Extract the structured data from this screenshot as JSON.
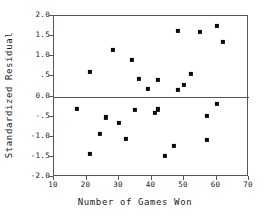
{
  "chart_data": {
    "type": "scatter",
    "title": "",
    "xlabel": "Number of Games Won",
    "ylabel": "Standardized Residual",
    "xlim": [
      10,
      70
    ],
    "ylim": [
      -2.0,
      2.0
    ],
    "grid": false,
    "legend": null,
    "xticks": [
      10,
      20,
      30,
      40,
      50,
      60,
      70
    ],
    "xticklabels": [
      "10",
      "20",
      "30",
      "40",
      "50",
      "60",
      "70"
    ],
    "yticks": [
      2.0,
      1.5,
      1.0,
      0.5,
      0.0,
      -0.5,
      -1.0,
      -1.5,
      -2.0
    ],
    "yticklabels": [
      "2.0",
      "1.5",
      "1.0",
      ".5",
      "0.0",
      "-.5",
      "-1.0",
      "-1.5",
      "-2.0"
    ],
    "reference_line": {
      "axis": "y",
      "value": 0.0
    },
    "marker": "filled-square",
    "marker_color": "#0a0a0a",
    "points": [
      {
        "x": 17,
        "y": -0.3
      },
      {
        "x": 21,
        "y": 0.62
      },
      {
        "x": 21,
        "y": -1.43
      },
      {
        "x": 24,
        "y": -0.93
      },
      {
        "x": 26,
        "y": -0.52
      },
      {
        "x": 28,
        "y": 1.16
      },
      {
        "x": 30,
        "y": -0.65
      },
      {
        "x": 32,
        "y": -1.05
      },
      {
        "x": 34,
        "y": 0.9
      },
      {
        "x": 35,
        "y": -0.33
      },
      {
        "x": 36,
        "y": 0.43
      },
      {
        "x": 39,
        "y": 0.18
      },
      {
        "x": 41,
        "y": -0.4
      },
      {
        "x": 42,
        "y": -0.32
      },
      {
        "x": 42,
        "y": 0.41
      },
      {
        "x": 44,
        "y": -1.47
      },
      {
        "x": 47,
        "y": -1.22
      },
      {
        "x": 48,
        "y": 0.16
      },
      {
        "x": 48,
        "y": 1.62
      },
      {
        "x": 50,
        "y": 0.28
      },
      {
        "x": 52,
        "y": 0.56
      },
      {
        "x": 55,
        "y": 1.6
      },
      {
        "x": 57,
        "y": -0.49
      },
      {
        "x": 57,
        "y": -1.08
      },
      {
        "x": 60,
        "y": 1.76
      },
      {
        "x": 60,
        "y": -0.19
      },
      {
        "x": 62,
        "y": 1.35
      }
    ]
  },
  "colors": {
    "axis": "#55565a",
    "text": "#1a1a1a",
    "marker": "#0a0a0a",
    "background": "#ffffff"
  }
}
